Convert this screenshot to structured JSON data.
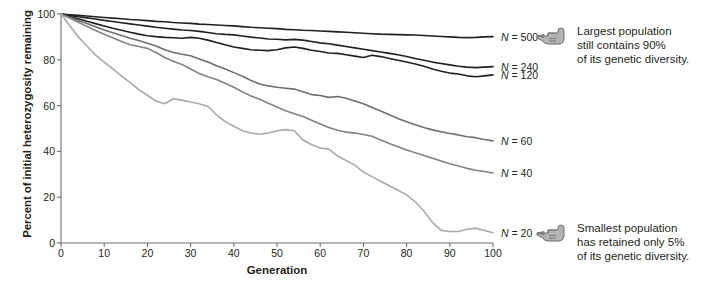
{
  "chart_data": {
    "type": "line",
    "title": "",
    "xlabel": "Generation",
    "ylabel": "Percent of initial heterozygosity remaining",
    "xlim": [
      0,
      100
    ],
    "ylim": [
      0,
      100
    ],
    "xticks": [
      0,
      10,
      20,
      30,
      40,
      50,
      60,
      70,
      80,
      90,
      100
    ],
    "yticks": [
      0,
      20,
      40,
      60,
      80,
      100
    ],
    "grid": false,
    "legend_position": "right-of-line-ends",
    "series": [
      {
        "name": "N = 500",
        "label": "N = 500",
        "color": "#231f20",
        "x": [
          0,
          2,
          4,
          6,
          8,
          10,
          12,
          14,
          16,
          18,
          20,
          22,
          24,
          26,
          28,
          30,
          32,
          34,
          36,
          38,
          40,
          42,
          44,
          46,
          48,
          50,
          52,
          54,
          56,
          58,
          60,
          62,
          64,
          66,
          68,
          70,
          72,
          74,
          76,
          78,
          80,
          82,
          84,
          86,
          88,
          90,
          92,
          94,
          96,
          98,
          100
        ],
        "values": [
          100,
          99.7,
          99.4,
          99.1,
          98.8,
          98.5,
          98.2,
          97.9,
          97.6,
          97.4,
          97.1,
          96.8,
          96.6,
          96.3,
          96.1,
          95.9,
          95.6,
          95.4,
          95.2,
          95.0,
          94.8,
          94.5,
          94.2,
          94.0,
          93.8,
          93.6,
          93.3,
          93.1,
          92.9,
          92.8,
          92.6,
          92.4,
          92.2,
          92.0,
          91.8,
          91.6,
          91.4,
          91.2,
          91.1,
          91.0,
          90.9,
          90.8,
          90.6,
          90.4,
          90.2,
          90.0,
          89.8,
          89.7,
          89.8,
          90.0,
          90.1
        ]
      },
      {
        "name": "N = 240",
        "label": "N = 240",
        "color": "#231f20",
        "x": [
          0,
          2,
          4,
          6,
          8,
          10,
          12,
          14,
          16,
          18,
          20,
          22,
          24,
          26,
          28,
          30,
          32,
          34,
          36,
          38,
          40,
          42,
          44,
          46,
          48,
          50,
          52,
          54,
          56,
          58,
          60,
          62,
          64,
          66,
          68,
          70,
          72,
          74,
          76,
          78,
          80,
          82,
          84,
          86,
          88,
          90,
          92,
          94,
          96,
          98,
          100
        ],
        "values": [
          100,
          99.4,
          98.8,
          98.3,
          97.8,
          97.2,
          96.7,
          96.2,
          95.7,
          95.2,
          94.7,
          94.2,
          93.8,
          93.4,
          93.0,
          92.8,
          92.4,
          91.9,
          91.4,
          91.1,
          90.9,
          90.4,
          89.9,
          89.5,
          89.1,
          89.0,
          88.7,
          88.9,
          88.6,
          88.0,
          87.4,
          87.0,
          86.4,
          85.8,
          85.2,
          84.6,
          84.0,
          83.4,
          82.8,
          82.2,
          81.4,
          80.6,
          79.8,
          79.0,
          78.4,
          77.8,
          77.2,
          76.8,
          76.6,
          76.8,
          77.0
        ]
      },
      {
        "name": "N = 120",
        "label": "N = 120",
        "color": "#231f20",
        "x": [
          0,
          2,
          4,
          6,
          8,
          10,
          12,
          14,
          16,
          18,
          20,
          22,
          24,
          26,
          28,
          30,
          32,
          34,
          36,
          38,
          40,
          42,
          44,
          46,
          48,
          50,
          52,
          54,
          56,
          58,
          60,
          62,
          64,
          66,
          68,
          70,
          72,
          74,
          76,
          78,
          80,
          82,
          84,
          86,
          88,
          90,
          92,
          94,
          96,
          98,
          100
        ],
        "values": [
          100,
          98.9,
          97.9,
          96.8,
          95.8,
          94.8,
          93.8,
          92.9,
          92.0,
          91.2,
          90.5,
          90.1,
          89.8,
          89.6,
          89.4,
          89.8,
          89.4,
          88.6,
          87.6,
          86.6,
          85.6,
          85.0,
          84.4,
          84.2,
          84.0,
          84.4,
          85.2,
          85.6,
          85.0,
          84.2,
          83.6,
          83.0,
          82.8,
          82.2,
          81.6,
          81.0,
          82.0,
          81.4,
          80.6,
          79.8,
          79.0,
          78.2,
          77.2,
          76.0,
          75.0,
          74.2,
          73.8,
          73.0,
          72.6,
          73.0,
          73.4
        ]
      },
      {
        "name": "N = 60",
        "label": "N = 60",
        "color": "#6d6e71",
        "x": [
          0,
          2,
          4,
          6,
          8,
          10,
          12,
          14,
          16,
          18,
          20,
          22,
          24,
          26,
          28,
          30,
          32,
          34,
          36,
          38,
          40,
          42,
          44,
          46,
          48,
          50,
          52,
          54,
          56,
          58,
          60,
          62,
          64,
          66,
          68,
          70,
          72,
          74,
          76,
          78,
          80,
          82,
          84,
          86,
          88,
          90,
          92,
          94,
          96,
          98,
          100
        ],
        "values": [
          100,
          98.6,
          97.2,
          95.8,
          94.4,
          93.0,
          91.8,
          90.6,
          89.4,
          88.4,
          87.2,
          86.0,
          84.4,
          83.2,
          82.4,
          81.8,
          80.4,
          79.0,
          77.4,
          76.0,
          74.4,
          72.8,
          71.0,
          69.4,
          68.6,
          68.0,
          67.6,
          67.2,
          66.0,
          64.8,
          64.4,
          63.6,
          64.0,
          63.2,
          62.0,
          60.8,
          59.2,
          57.6,
          56.0,
          54.4,
          53.0,
          51.6,
          50.4,
          49.4,
          48.6,
          47.8,
          47.2,
          46.4,
          46.0,
          45.2,
          44.6
        ]
      },
      {
        "name": "N = 40",
        "label": "N = 40",
        "color": "#808285",
        "x": [
          0,
          2,
          4,
          6,
          8,
          10,
          12,
          14,
          16,
          18,
          20,
          22,
          24,
          26,
          28,
          30,
          32,
          34,
          36,
          38,
          40,
          42,
          44,
          46,
          48,
          50,
          52,
          54,
          56,
          58,
          60,
          62,
          64,
          66,
          68,
          70,
          72,
          74,
          76,
          78,
          80,
          82,
          84,
          86,
          88,
          90,
          92,
          94,
          96,
          98,
          100
        ],
        "values": [
          100,
          98.2,
          96.4,
          94.6,
          92.8,
          91.2,
          89.6,
          88.0,
          86.6,
          85.8,
          85.0,
          83.2,
          81.0,
          79.4,
          78.0,
          76.0,
          74.0,
          72.6,
          71.4,
          69.8,
          68.0,
          66.0,
          64.2,
          62.8,
          61.0,
          59.4,
          57.8,
          56.4,
          55.2,
          53.6,
          52.0,
          50.4,
          49.2,
          48.4,
          48.0,
          47.4,
          46.6,
          45.0,
          43.4,
          42.0,
          40.6,
          39.4,
          38.2,
          37.0,
          35.8,
          34.6,
          33.6,
          32.6,
          31.8,
          31.2,
          30.6
        ]
      },
      {
        "name": "N = 20",
        "label": "N = 20",
        "color": "#a7a9ac",
        "x": [
          0,
          2,
          4,
          6,
          8,
          10,
          12,
          14,
          16,
          18,
          20,
          22,
          24,
          26,
          28,
          30,
          32,
          34,
          36,
          38,
          40,
          42,
          44,
          46,
          48,
          50,
          52,
          54,
          56,
          58,
          60,
          62,
          64,
          66,
          68,
          70,
          72,
          74,
          76,
          78,
          80,
          82,
          84,
          86,
          88,
          90,
          92,
          94,
          96,
          98,
          100
        ],
        "values": [
          100,
          95.0,
          90.0,
          86.0,
          82.0,
          79.0,
          76.0,
          73.0,
          70.0,
          67.0,
          64.5,
          62.0,
          60.8,
          63.0,
          62.4,
          61.6,
          60.8,
          59.6,
          56.0,
          53.0,
          51.0,
          49.0,
          48.0,
          47.5,
          48.0,
          49.0,
          49.5,
          49.0,
          45.0,
          43.0,
          41.5,
          41.0,
          38.0,
          36.0,
          34.0,
          31.0,
          29.0,
          27.0,
          25.0,
          23.0,
          21.0,
          18.0,
          14.0,
          9.0,
          5.5,
          5.0,
          5.0,
          6.0,
          6.5,
          5.5,
          4.5
        ]
      }
    ],
    "annotations": [
      {
        "id": "largest-population",
        "icon": "pointing-hand-icon",
        "text": "Largest population\nstill contains 90%\nof its genetic diversity.",
        "points_to": "N = 500"
      },
      {
        "id": "smallest-population",
        "icon": "pointing-hand-icon",
        "text": "Smallest population\nhas retained only 5%\nof its genetic diversity.",
        "points_to": "N = 20"
      }
    ]
  }
}
